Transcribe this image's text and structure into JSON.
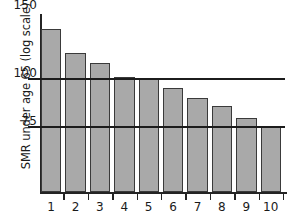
{
  "chart_data": {
    "type": "bar",
    "title": "",
    "xlabel": "",
    "ylabel": "SMR under age 65 (log scale)",
    "yscale": "log",
    "ylim": [
      50,
      157
    ],
    "grid": true,
    "gridlines": [
      100,
      75
    ],
    "legend": "none",
    "yticks": [
      {
        "label": "150",
        "value": 150
      },
      {
        "label": "100",
        "value": 100
      },
      {
        "label": "75",
        "value": 75
      }
    ],
    "categories": [
      "1",
      "2",
      "3",
      "4",
      "5",
      "6",
      "7",
      "8",
      "9",
      "10"
    ],
    "values": [
      135,
      117,
      110,
      101,
      100,
      95,
      89,
      85,
      79,
      75
    ],
    "bar_color": "#a9a9a9",
    "bar_edge_color": "#3a3a3a",
    "axis_color": "#242424",
    "gridline_color": "#1c1c1c",
    "text_color": "#1a1a1a",
    "background": "#ffffff"
  }
}
